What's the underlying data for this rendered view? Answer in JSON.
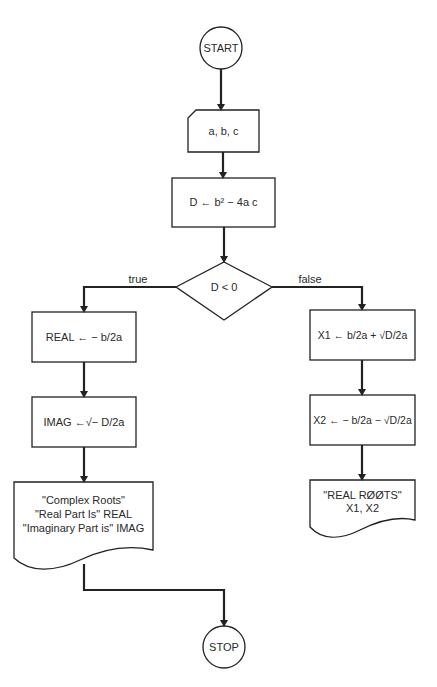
{
  "flowchart": {
    "start": "START",
    "input": "a, b, c",
    "compute_d": "D ← b² − 4a c",
    "decision": "D < 0",
    "true_label": "true",
    "false_label": "false",
    "real": "REAL ← − b/2a",
    "imag": "IMAG ←√− D/2a",
    "complex_output": [
      "\"Complex Roots\"",
      "\"Real Part Is\" REAL",
      "\"Imaginary Part is\" IMAG"
    ],
    "x1": "X1 ← b/2a + √D/2a",
    "x2": "X2 ← − b/2a − √D/2a",
    "real_output": [
      "\"REAL RØØTS\"",
      "X1, X2"
    ],
    "stop": "STOP"
  }
}
